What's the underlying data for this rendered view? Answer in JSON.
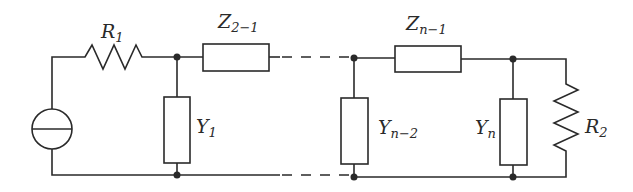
{
  "diagram": {
    "type": "ladder network circuit",
    "components": [
      {
        "id": "source",
        "kind": "current-source"
      },
      {
        "id": "R1",
        "kind": "resistor",
        "label": "R",
        "sub": "1"
      },
      {
        "id": "Z21",
        "kind": "impedance",
        "label": "Z",
        "sub": "2−1"
      },
      {
        "id": "Y1",
        "kind": "admittance",
        "label": "Y",
        "sub": "1"
      },
      {
        "id": "Yn2",
        "kind": "admittance",
        "label": "Y",
        "sub": "n−2"
      },
      {
        "id": "Zn1",
        "kind": "impedance",
        "label": "Z",
        "sub": "n−1"
      },
      {
        "id": "Yn",
        "kind": "admittance",
        "label": "Y",
        "sub": "n"
      },
      {
        "id": "R2",
        "kind": "resistor",
        "label": "R",
        "sub": "2"
      }
    ],
    "colors": {
      "stroke": "#2a2a2a",
      "background": "#ffffff"
    }
  }
}
